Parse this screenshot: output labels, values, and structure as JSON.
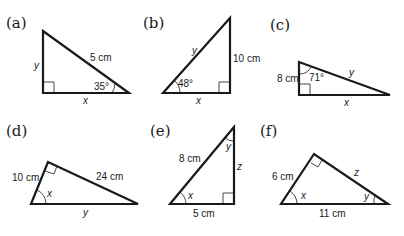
{
  "diagrams": {
    "a": {
      "label": "(a)",
      "hypotenuse": "5 cm",
      "vertical_side": "y",
      "horizontal_side": "x",
      "angle": "35°"
    },
    "b": {
      "label": "(b)",
      "hypotenuse": "y",
      "vertical_side": "10 cm",
      "horizontal_side": "x",
      "angle": "48°"
    },
    "c": {
      "label": "(c)",
      "hypotenuse": "y",
      "vertical_side": "8 cm",
      "horizontal_side": "x",
      "angle": "71°"
    },
    "d": {
      "label": "(d)",
      "short_side": "10 cm",
      "long_side": "24 cm",
      "base": "y",
      "angle": "x"
    },
    "e": {
      "label": "(e)",
      "hypotenuse": "8 cm",
      "vertical_side": "z",
      "horizontal_side": "5 cm",
      "angle_bottom": "x",
      "angle_top": "y"
    },
    "f": {
      "label": "(f)",
      "short_side": "6 cm",
      "long_side": "z",
      "base": "11 cm",
      "angle_left": "x",
      "angle_right": "y"
    }
  }
}
